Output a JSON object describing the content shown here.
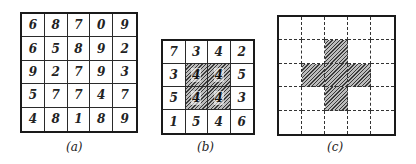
{
  "figure": {
    "panels": [
      {
        "id": "a",
        "caption": "(a)",
        "rows": 5,
        "cols": 5,
        "line_style": "solid",
        "values": [
          [
            "6",
            "8",
            "7",
            "0",
            "9"
          ],
          [
            "6",
            "5",
            "8",
            "9",
            "2"
          ],
          [
            "9",
            "2",
            "7",
            "9",
            "3"
          ],
          [
            "5",
            "7",
            "7",
            "4",
            "7"
          ],
          [
            "4",
            "8",
            "1",
            "8",
            "9"
          ]
        ],
        "hatched": []
      },
      {
        "id": "b",
        "caption": "(b)",
        "rows": 4,
        "cols": 4,
        "line_style": "solid",
        "values": [
          [
            "7",
            "3",
            "4",
            "2"
          ],
          [
            "3",
            "4",
            "4",
            "5"
          ],
          [
            "5",
            "4",
            "4",
            "3"
          ],
          [
            "1",
            "5",
            "4",
            "6"
          ]
        ],
        "hatched": [
          [
            1,
            1
          ],
          [
            1,
            2
          ],
          [
            2,
            1
          ],
          [
            2,
            2
          ]
        ]
      },
      {
        "id": "c",
        "caption": "(c)",
        "rows": 5,
        "cols": 5,
        "line_style": "dashed",
        "values": [],
        "hatched": [
          [
            1,
            2
          ],
          [
            2,
            1
          ],
          [
            2,
            2
          ],
          [
            2,
            3
          ],
          [
            3,
            2
          ]
        ]
      }
    ]
  }
}
